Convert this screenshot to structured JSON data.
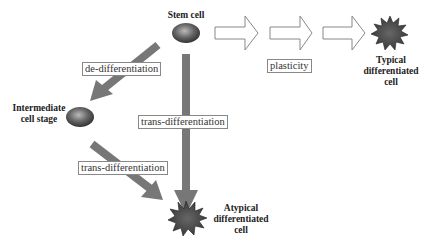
{
  "nodes": {
    "stem_cell": "Stem cell",
    "intermediate_line1": "Intermediate",
    "intermediate_line2": "cell stage",
    "typical_line1": "Typical",
    "typical_line2": "differentiated",
    "typical_line3": "cell",
    "atypical_line1": "Atypical",
    "atypical_line2": "differentiated",
    "atypical_line3": "cell"
  },
  "edges": {
    "de_differentiation": "de-differentiation",
    "trans_differentiation_direct": "trans-differentiation",
    "trans_differentiation_intermediate": "trans-differentiation",
    "plasticity": "plasticity"
  },
  "colors": {
    "arrow": "#777777",
    "cell": "#555555",
    "star": "#444444"
  }
}
